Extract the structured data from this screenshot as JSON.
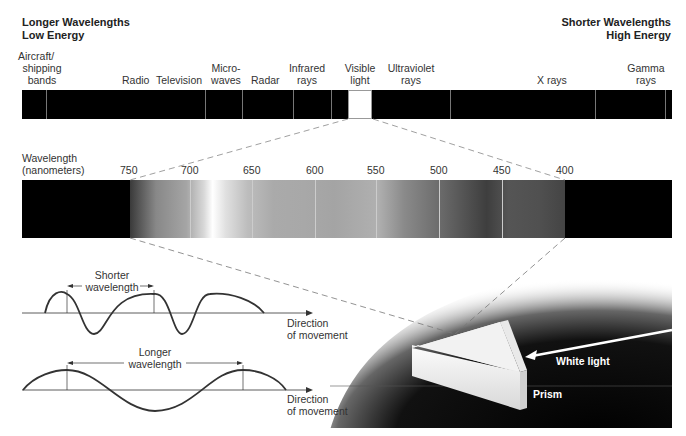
{
  "header": {
    "left_line1": "Longer Wavelengths",
    "left_line2": "Low Energy",
    "right_line1": "Shorter Wavelengths",
    "right_line2": "High Energy"
  },
  "em_spectrum": {
    "bands": [
      {
        "line1": "Aircraft/",
        "line2": "shipping",
        "line3": "bands"
      },
      {
        "line1": "Radio"
      },
      {
        "line1": "Television"
      },
      {
        "line1": "Micro-",
        "line2": "waves"
      },
      {
        "line1": "Radar"
      },
      {
        "line1": "Infrared",
        "line2": "rays"
      },
      {
        "line1": "Visible",
        "line2": "light"
      },
      {
        "line1": "Ultraviolet",
        "line2": "rays"
      },
      {
        "line1": "X rays"
      },
      {
        "line1": "Gamma",
        "line2": "rays"
      }
    ]
  },
  "visible_spectrum": {
    "axis_label_line1": "Wavelength",
    "axis_label_line2": "(nanometers)",
    "ticks": [
      "750",
      "700",
      "650",
      "600",
      "550",
      "500",
      "450",
      "400"
    ]
  },
  "waves": {
    "short": {
      "label_line1": "Shorter",
      "label_line2": "wavelength",
      "direction_line1": "Direction",
      "direction_line2": "of movement"
    },
    "long": {
      "label_line1": "Longer",
      "label_line2": "wavelength",
      "direction_line1": "Direction",
      "direction_line2": "of movement"
    }
  },
  "prism": {
    "white_light_label": "White light",
    "prism_label": "Prism"
  }
}
